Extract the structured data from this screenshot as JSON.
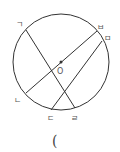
{
  "diagram": {
    "type": "circle-chords",
    "colors": {
      "stroke": "#333333",
      "label": "#555555",
      "background": "#ffffff"
    },
    "circle": {
      "cx": 61,
      "cy": 62,
      "r": 48,
      "center_label": "O"
    },
    "points": {
      "giyeok": {
        "label": "ㄱ",
        "x": 26,
        "y": 30
      },
      "nieun": {
        "label": "ㄴ",
        "x": 26,
        "y": 93
      },
      "digeut": {
        "label": "ㄷ",
        "x": 51,
        "y": 110
      },
      "rieul": {
        "label": "ㄹ",
        "x": 75,
        "y": 108
      },
      "mieum": {
        "label": "ㅁ",
        "x": 102,
        "y": 41
      },
      "bieup": {
        "label": "ㅂ",
        "x": 97,
        "y": 31
      }
    },
    "chords": [
      {
        "from": "ㄱ",
        "to": "ㄹ"
      },
      {
        "from": "ㄴ",
        "to": "ㅂ",
        "through_center": true
      },
      {
        "from": "ㄷ",
        "to": "ㅁ"
      }
    ],
    "answer_blank": "("
  }
}
